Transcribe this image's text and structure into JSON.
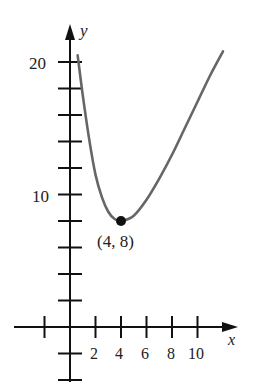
{
  "chart_data": {
    "type": "line",
    "title": "",
    "xlabel": "x",
    "ylabel": "y",
    "x_ticks": [
      -2,
      0,
      2,
      4,
      6,
      8,
      10
    ],
    "x_tick_labels": [
      "2",
      "4",
      "6",
      "8",
      "10"
    ],
    "y_ticks": [
      -4,
      -2,
      0,
      2,
      4,
      6,
      8,
      10,
      12,
      14,
      16,
      18,
      20
    ],
    "y_tick_labels": [
      "10",
      "20"
    ],
    "xlim": [
      -3,
      13
    ],
    "ylim": [
      -5,
      22
    ],
    "grid": false,
    "series": [
      {
        "name": "curve",
        "x": [
          0.6,
          1,
          1.5,
          2,
          2.5,
          3,
          3.5,
          4,
          5,
          6,
          7,
          8,
          9,
          10,
          11,
          12
        ],
        "y": [
          20.5,
          17.5,
          14.2,
          11.5,
          9.8,
          8.7,
          8.15,
          8,
          8.4,
          9.6,
          11.2,
          13.0,
          15.0,
          17.0,
          19.0,
          20.8
        ]
      }
    ],
    "annotations": [
      {
        "type": "point",
        "x": 4,
        "y": 8,
        "label": "(4, 8)"
      }
    ]
  },
  "labels": {
    "x_axis": "x",
    "y_axis": "y",
    "point_label": "(4, 8)",
    "y20": "20",
    "y10": "10",
    "x2": "2",
    "x4": "4",
    "x6": "6",
    "x8": "8",
    "x10": "10"
  }
}
